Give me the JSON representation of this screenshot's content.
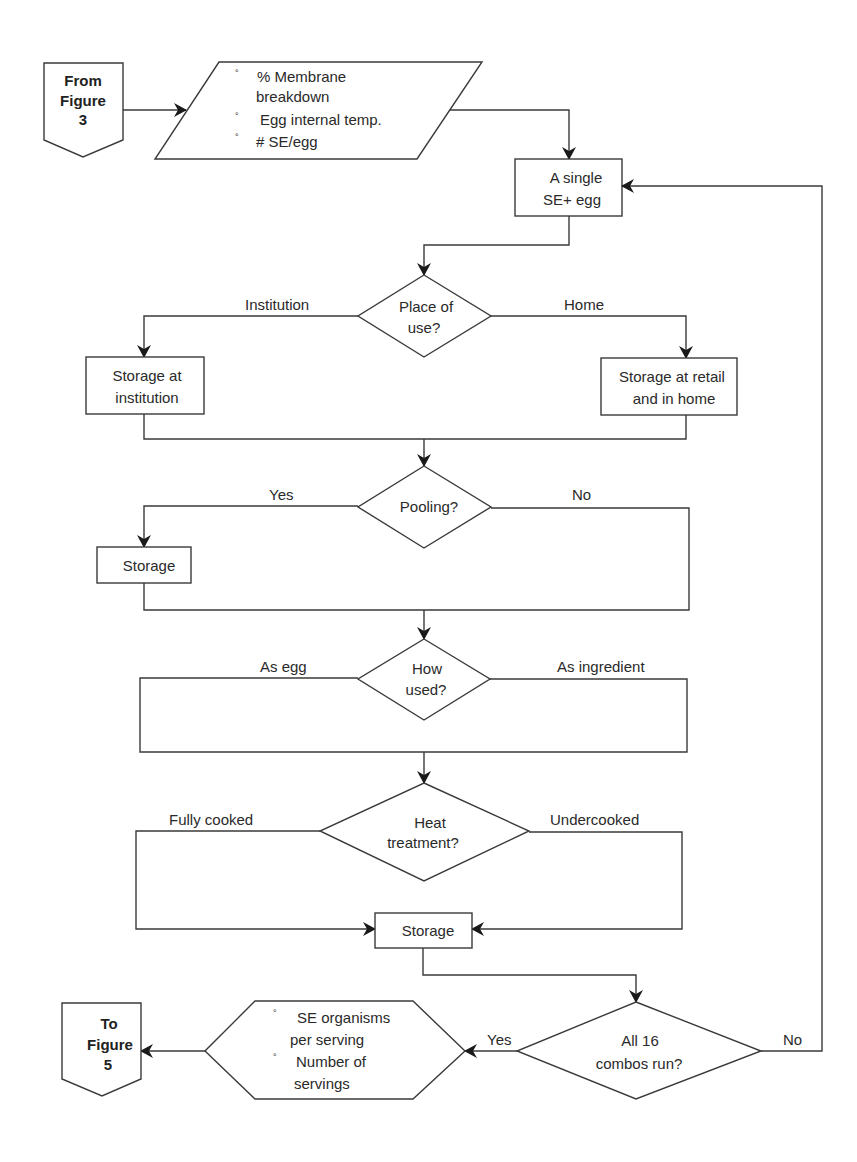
{
  "diagram": {
    "type": "flowchart",
    "colors": {
      "line": "#3a3a3a",
      "fill": "#ffffff",
      "text": "#2a2a2a"
    },
    "connectors": {
      "from": {
        "line1": "From",
        "line2": "Figure",
        "line3": "3"
      },
      "to": {
        "line1": "To",
        "line2": "Figure",
        "line3": "5"
      }
    },
    "inputs": {
      "bullet": "°",
      "items": [
        {
          "line1": "% Membrane",
          "line2": "breakdown"
        },
        {
          "line1": "Egg internal temp."
        },
        {
          "line1": "# SE/egg"
        }
      ]
    },
    "start_box": {
      "line1": "A single",
      "line2": "SE+ egg"
    },
    "decisions": {
      "place": {
        "line1": "Place of",
        "line2": "use?",
        "left_label": "Institution",
        "right_label": "Home"
      },
      "pooling": {
        "line1": "Pooling?",
        "left_label": "Yes",
        "right_label": "No"
      },
      "how_used": {
        "line1": "How",
        "line2": "used?",
        "left_label": "As egg",
        "right_label": "As ingredient"
      },
      "heat": {
        "line1": "Heat",
        "line2": "treatment?",
        "left_label": "Fully cooked",
        "right_label": "Undercooked"
      },
      "combos": {
        "line1": "All 16",
        "line2": "combos run?",
        "left_label": "Yes",
        "right_label": "No"
      }
    },
    "boxes": {
      "institution": {
        "line1": "Storage at",
        "line2": "institution"
      },
      "retail": {
        "line1": "Storage at retail",
        "line2": "and in home"
      },
      "pool_storage": {
        "line1": "Storage"
      },
      "final_storage": {
        "line1": "Storage"
      }
    },
    "outputs": {
      "bullet": "°",
      "items": [
        {
          "line1": "SE organisms",
          "line2": "per serving"
        },
        {
          "line1": "Number of",
          "line2": "servings"
        }
      ]
    }
  }
}
